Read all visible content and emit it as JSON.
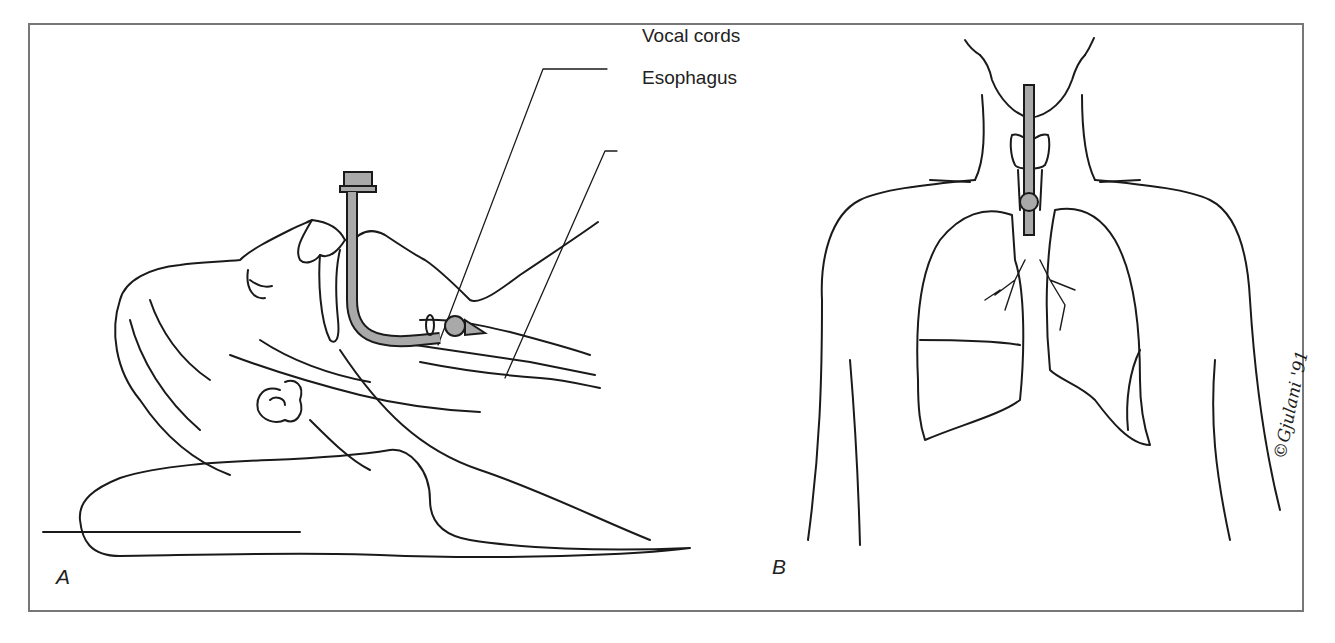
{
  "figure": {
    "panels": [
      {
        "id": "A",
        "letter": "A",
        "description": "Side view of supine patient with head tilted back on pillow and endotracheal tube inserted through mouth past vocal cords into trachea, cuff inflated"
      },
      {
        "id": "B",
        "letter": "B",
        "description": "Front view of torso showing endotracheal tube in trachea with inflated cuff above the lungs"
      }
    ],
    "labels": {
      "vocal_cords": "Vocal cords",
      "esophagus": "Esophagus"
    },
    "signature": "©Gjulani '91",
    "colors": {
      "line": "#1a1a1a",
      "tube": "#a9a9a9",
      "frame": "#777777"
    }
  }
}
